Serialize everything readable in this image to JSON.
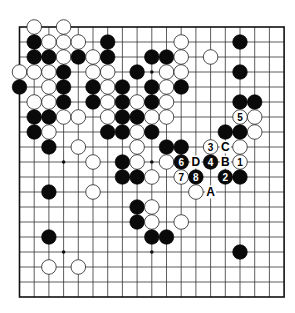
{
  "board": {
    "size": 19,
    "origin_x": 19.5,
    "origin_y": 27,
    "spacing_x": 14.7,
    "spacing_y": 15.0,
    "stone_radius": 7.3,
    "colors": {
      "black": "#0a0a0a",
      "white": "#ffffff",
      "line": "#333333"
    },
    "star_points": [
      [
        3,
        3
      ],
      [
        9,
        3
      ],
      [
        15,
        3
      ],
      [
        3,
        9
      ],
      [
        9,
        9
      ],
      [
        15,
        9
      ],
      [
        3,
        15
      ],
      [
        9,
        15
      ],
      [
        15,
        15
      ]
    ]
  },
  "stones": [
    {
      "c": 1,
      "r": 0,
      "color": "white"
    },
    {
      "c": 3,
      "r": 0,
      "color": "white"
    },
    {
      "c": 1,
      "r": 1,
      "color": "black"
    },
    {
      "c": 2,
      "r": 1,
      "color": "white"
    },
    {
      "c": 3,
      "r": 1,
      "color": "white"
    },
    {
      "c": 4,
      "r": 1,
      "color": "white"
    },
    {
      "c": 6,
      "r": 1,
      "color": "black"
    },
    {
      "c": 11,
      "r": 1,
      "color": "white"
    },
    {
      "c": 15,
      "r": 1,
      "color": "black"
    },
    {
      "c": 1,
      "r": 2,
      "color": "black"
    },
    {
      "c": 2,
      "r": 2,
      "color": "black"
    },
    {
      "c": 3,
      "r": 2,
      "color": "white"
    },
    {
      "c": 4,
      "r": 2,
      "color": "black"
    },
    {
      "c": 5,
      "r": 2,
      "color": "white"
    },
    {
      "c": 6,
      "r": 2,
      "color": "black"
    },
    {
      "c": 9,
      "r": 2,
      "color": "black"
    },
    {
      "c": 10,
      "r": 2,
      "color": "black"
    },
    {
      "c": 11,
      "r": 2,
      "color": "white"
    },
    {
      "c": 13,
      "r": 2,
      "color": "white"
    },
    {
      "c": 0,
      "r": 3,
      "color": "white"
    },
    {
      "c": 1,
      "r": 3,
      "color": "white"
    },
    {
      "c": 2,
      "r": 3,
      "color": "white"
    },
    {
      "c": 3,
      "r": 3,
      "color": "black"
    },
    {
      "c": 5,
      "r": 3,
      "color": "white"
    },
    {
      "c": 6,
      "r": 3,
      "color": "white"
    },
    {
      "c": 8,
      "r": 3,
      "color": "black"
    },
    {
      "c": 10,
      "r": 3,
      "color": "white"
    },
    {
      "c": 11,
      "r": 3,
      "color": "white"
    },
    {
      "c": 15,
      "r": 3,
      "color": "black"
    },
    {
      "c": 0,
      "r": 4,
      "color": "black"
    },
    {
      "c": 2,
      "r": 4,
      "color": "white"
    },
    {
      "c": 3,
      "r": 4,
      "color": "black"
    },
    {
      "c": 5,
      "r": 4,
      "color": "black"
    },
    {
      "c": 6,
      "r": 4,
      "color": "white"
    },
    {
      "c": 7,
      "r": 4,
      "color": "black"
    },
    {
      "c": 9,
      "r": 4,
      "color": "black"
    },
    {
      "c": 10,
      "r": 4,
      "color": "white"
    },
    {
      "c": 11,
      "r": 4,
      "color": "black"
    },
    {
      "c": 1,
      "r": 5,
      "color": "white"
    },
    {
      "c": 2,
      "r": 5,
      "color": "white"
    },
    {
      "c": 3,
      "r": 5,
      "color": "black"
    },
    {
      "c": 5,
      "r": 5,
      "color": "black"
    },
    {
      "c": 6,
      "r": 5,
      "color": "white"
    },
    {
      "c": 7,
      "r": 5,
      "color": "black"
    },
    {
      "c": 8,
      "r": 5,
      "color": "white"
    },
    {
      "c": 9,
      "r": 5,
      "color": "black"
    },
    {
      "c": 10,
      "r": 5,
      "color": "white"
    },
    {
      "c": 15,
      "r": 5,
      "color": "black"
    },
    {
      "c": 16,
      "r": 5,
      "color": "black"
    },
    {
      "c": 1,
      "r": 6,
      "color": "black"
    },
    {
      "c": 2,
      "r": 6,
      "color": "black"
    },
    {
      "c": 3,
      "r": 6,
      "color": "white"
    },
    {
      "c": 4,
      "r": 6,
      "color": "white"
    },
    {
      "c": 6,
      "r": 6,
      "color": "white"
    },
    {
      "c": 7,
      "r": 6,
      "color": "black"
    },
    {
      "c": 8,
      "r": 6,
      "color": "black"
    },
    {
      "c": 9,
      "r": 6,
      "color": "white"
    },
    {
      "c": 10,
      "r": 6,
      "color": "white"
    },
    {
      "c": 15,
      "r": 6,
      "color": "white",
      "label": "5"
    },
    {
      "c": 16,
      "r": 6,
      "color": "white"
    },
    {
      "c": 1,
      "r": 7,
      "color": "black"
    },
    {
      "c": 2,
      "r": 7,
      "color": "white"
    },
    {
      "c": 6,
      "r": 7,
      "color": "black"
    },
    {
      "c": 7,
      "r": 7,
      "color": "black"
    },
    {
      "c": 8,
      "r": 7,
      "color": "white"
    },
    {
      "c": 9,
      "r": 7,
      "color": "black"
    },
    {
      "c": 14,
      "r": 7,
      "color": "black"
    },
    {
      "c": 15,
      "r": 7,
      "color": "black"
    },
    {
      "c": 16,
      "r": 7,
      "color": "white"
    },
    {
      "c": 2,
      "r": 8,
      "color": "black"
    },
    {
      "c": 4,
      "r": 8,
      "color": "white"
    },
    {
      "c": 8,
      "r": 8,
      "color": "white"
    },
    {
      "c": 10,
      "r": 8,
      "color": "black"
    },
    {
      "c": 11,
      "r": 8,
      "color": "black"
    },
    {
      "c": 13,
      "r": 8,
      "color": "white",
      "label": "3"
    },
    {
      "c": 15,
      "r": 8,
      "color": "white"
    },
    {
      "c": 5,
      "r": 9,
      "color": "white"
    },
    {
      "c": 7,
      "r": 9,
      "color": "black"
    },
    {
      "c": 8,
      "r": 9,
      "color": "white"
    },
    {
      "c": 10,
      "r": 9,
      "color": "white"
    },
    {
      "c": 11,
      "r": 9,
      "color": "black",
      "label": "6"
    },
    {
      "c": 13,
      "r": 9,
      "color": "black",
      "label": "4"
    },
    {
      "c": 15,
      "r": 9,
      "color": "white",
      "label": "1"
    },
    {
      "c": 7,
      "r": 10,
      "color": "black"
    },
    {
      "c": 8,
      "r": 10,
      "color": "black"
    },
    {
      "c": 9,
      "r": 10,
      "color": "white"
    },
    {
      "c": 11,
      "r": 10,
      "color": "white",
      "label": "7"
    },
    {
      "c": 12,
      "r": 10,
      "color": "black",
      "label": "8"
    },
    {
      "c": 14,
      "r": 10,
      "color": "black",
      "label": "2"
    },
    {
      "c": 15,
      "r": 10,
      "color": "black"
    },
    {
      "c": 2,
      "r": 11,
      "color": "black"
    },
    {
      "c": 5,
      "r": 11,
      "color": "white"
    },
    {
      "c": 12,
      "r": 11,
      "color": "white"
    },
    {
      "c": 8,
      "r": 12,
      "color": "black"
    },
    {
      "c": 9,
      "r": 12,
      "color": "white"
    },
    {
      "c": 8,
      "r": 13,
      "color": "black"
    },
    {
      "c": 9,
      "r": 13,
      "color": "white"
    },
    {
      "c": 11,
      "r": 13,
      "color": "white"
    },
    {
      "c": 2,
      "r": 14,
      "color": "black"
    },
    {
      "c": 9,
      "r": 14,
      "color": "black"
    },
    {
      "c": 10,
      "r": 14,
      "color": "black"
    },
    {
      "c": 15,
      "r": 15,
      "color": "black"
    },
    {
      "c": 2,
      "r": 16,
      "color": "white"
    },
    {
      "c": 4,
      "r": 16,
      "color": "white"
    }
  ],
  "letters": [
    {
      "c": 14,
      "r": 8,
      "text": "C"
    },
    {
      "c": 12,
      "r": 9,
      "text": "D"
    },
    {
      "c": 14,
      "r": 9,
      "text": "B"
    },
    {
      "c": 13,
      "r": 11,
      "text": "A"
    }
  ]
}
